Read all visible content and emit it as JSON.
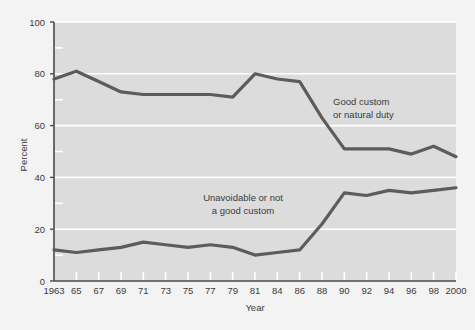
{
  "chart_data": {
    "type": "line",
    "title": "",
    "xlabel": "Year",
    "ylabel": "Percent",
    "xlim": [
      1963,
      2000
    ],
    "ylim": [
      0,
      100
    ],
    "grid": true,
    "legend_position": "inline-annotation",
    "x": [
      1963,
      1965,
      1967,
      1969,
      1971,
      1973,
      1975,
      1977,
      1979,
      1981,
      1984,
      1986,
      1988,
      1990,
      1992,
      1994,
      1996,
      1998,
      2000
    ],
    "xtick_labels": [
      "1963",
      "65",
      "67",
      "69",
      "71",
      "73",
      "75",
      "77",
      "79",
      "81",
      "84",
      "86",
      "88",
      "90",
      "92",
      "94",
      "96",
      "98",
      "2000"
    ],
    "ytick_labels": [
      "0",
      "20",
      "40",
      "60",
      "80",
      "100"
    ],
    "yticks": [
      0,
      20,
      40,
      60,
      80,
      100
    ],
    "yminor_ticks": [
      10,
      30,
      50,
      70,
      90
    ],
    "series": [
      {
        "name": "Good custom or natural duty",
        "color": "#5c5c5c",
        "values": [
          78,
          81,
          77,
          73,
          72,
          72,
          72,
          72,
          71,
          80,
          78,
          77,
          63,
          51,
          51,
          51,
          49,
          52,
          48
        ]
      },
      {
        "name": "Unavoidable or not a good custom",
        "color": "#5c5c5c",
        "values": [
          12,
          11,
          12,
          13,
          15,
          14,
          13,
          14,
          13,
          10,
          11,
          12,
          22,
          34,
          33,
          35,
          34,
          35,
          36
        ]
      }
    ],
    "annotations": [
      {
        "id": "upper-annotation",
        "lines": [
          "Good custom",
          "or natural duty"
        ],
        "x": 1990,
        "y": 66
      },
      {
        "id": "lower-annotation",
        "lines": [
          "Unavoidable or not",
          "a good custom"
        ],
        "x": 1981,
        "y": 28
      }
    ],
    "colors": {
      "plot_background": "#dcdcdc",
      "page_background": "#f3f3f3",
      "gridline": "#ffffff",
      "line": "#5c5c5c",
      "axis": "#4a4a4a",
      "text": "#3b3b3b"
    }
  }
}
